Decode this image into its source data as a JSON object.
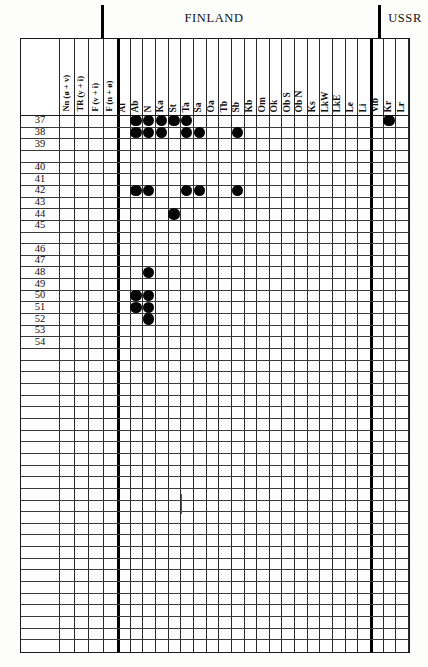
{
  "document": {
    "type": "distribution-grid-table",
    "caption_top": [
      "FINLAND",
      "USSR"
    ]
  },
  "header": {
    "finland_label": "FINLAND",
    "ussr_label": "USSR"
  },
  "grid": {
    "row_label_header": "",
    "columns": [
      {
        "key": "Nn",
        "label": "Nn (ø + v)",
        "group": "left",
        "wide": true
      },
      {
        "key": "TR",
        "label": "TR (y + i)",
        "group": "left",
        "wide": true
      },
      {
        "key": "Fvi",
        "label": "F (v + i)",
        "group": "left",
        "wide": true
      },
      {
        "key": "Fno",
        "label": "F (n + ø)",
        "group": "left",
        "wide": true
      },
      {
        "key": "Al",
        "label": "Al",
        "group": "finland",
        "wide": false
      },
      {
        "key": "Ab",
        "label": "Ab",
        "group": "finland",
        "wide": false
      },
      {
        "key": "N",
        "label": "N",
        "group": "finland",
        "wide": false
      },
      {
        "key": "Ka",
        "label": "Ka",
        "group": "finland",
        "wide": false
      },
      {
        "key": "St",
        "label": "St",
        "group": "finland",
        "wide": false
      },
      {
        "key": "Ta",
        "label": "Ta",
        "group": "finland",
        "wide": false
      },
      {
        "key": "Sa",
        "label": "Sa",
        "group": "finland",
        "wide": false
      },
      {
        "key": "Oa",
        "label": "Oa",
        "group": "finland",
        "wide": false
      },
      {
        "key": "Tb",
        "label": "Tb",
        "group": "finland",
        "wide": false
      },
      {
        "key": "Sb",
        "label": "Sb",
        "group": "finland",
        "wide": false
      },
      {
        "key": "Kb",
        "label": "Kb",
        "group": "finland",
        "wide": false
      },
      {
        "key": "Om",
        "label": "Om",
        "group": "finland",
        "wide": false
      },
      {
        "key": "Ok",
        "label": "Ok",
        "group": "finland",
        "wide": false
      },
      {
        "key": "ObS",
        "label": "Ob S",
        "group": "finland",
        "wide": false
      },
      {
        "key": "ObN",
        "label": "Ob N",
        "group": "finland",
        "wide": false
      },
      {
        "key": "Ks",
        "label": "Ks",
        "group": "finland",
        "wide": false
      },
      {
        "key": "LkW",
        "label": "LkW",
        "group": "finland",
        "wide": false
      },
      {
        "key": "LkE",
        "label": "LkE",
        "group": "finland",
        "wide": false
      },
      {
        "key": "Le",
        "label": "Le",
        "group": "finland",
        "wide": false
      },
      {
        "key": "Li",
        "label": "Li",
        "group": "finland",
        "wide": false
      },
      {
        "key": "Vib",
        "label": "Vib",
        "group": "ussr",
        "wide": false
      },
      {
        "key": "Kr",
        "label": "Kr",
        "group": "ussr",
        "wide": false
      },
      {
        "key": "Lr",
        "label": "Lr",
        "group": "ussr",
        "wide": false
      }
    ],
    "rows": [
      {
        "label": "37",
        "dots": [
          "Ab",
          "N",
          "Ka",
          "St",
          "Ta",
          "Kr"
        ]
      },
      {
        "label": "38",
        "dots": [
          "Ab",
          "N",
          "Ka",
          "Ta",
          "Sa",
          "Sb"
        ]
      },
      {
        "label": "39",
        "dots": []
      },
      {
        "label": "",
        "dots": []
      },
      {
        "label": "40",
        "dots": []
      },
      {
        "label": "41",
        "dots": []
      },
      {
        "label": "42",
        "dots": [
          "Ab",
          "N",
          "Ta",
          "Sa",
          "Sb"
        ]
      },
      {
        "label": "43",
        "dots": []
      },
      {
        "label": "44",
        "dots": [
          "St"
        ]
      },
      {
        "label": "45",
        "dots": []
      },
      {
        "label": "",
        "dots": []
      },
      {
        "label": "46",
        "dots": []
      },
      {
        "label": "47",
        "dots": []
      },
      {
        "label": "48",
        "dots": [
          "N"
        ]
      },
      {
        "label": "49",
        "dots": []
      },
      {
        "label": "50",
        "dots": [
          "Ab",
          "N"
        ]
      },
      {
        "label": "51",
        "dots": [
          "Ab",
          "N"
        ]
      },
      {
        "label": "52",
        "dots": [
          "N"
        ]
      },
      {
        "label": "53",
        "dots": []
      },
      {
        "label": "54",
        "dots": []
      },
      {
        "label": "",
        "dots": []
      },
      {
        "label": "",
        "dots": []
      },
      {
        "label": "",
        "dots": []
      },
      {
        "label": "",
        "dots": []
      },
      {
        "label": "",
        "dots": []
      },
      {
        "label": "",
        "dots": []
      },
      {
        "label": "",
        "dots": []
      },
      {
        "label": "",
        "dots": []
      },
      {
        "label": "",
        "dots": []
      },
      {
        "label": "",
        "dots": []
      },
      {
        "label": "",
        "dots": []
      },
      {
        "label": "",
        "dots": []
      },
      {
        "label": "",
        "dots": []
      },
      {
        "label": "",
        "dots": []
      },
      {
        "label": "",
        "dots": []
      },
      {
        "label": "",
        "dots": []
      },
      {
        "label": "",
        "dots": []
      },
      {
        "label": "",
        "dots": []
      },
      {
        "label": "",
        "dots": []
      },
      {
        "label": "",
        "dots": []
      },
      {
        "label": "",
        "dots": []
      },
      {
        "label": "",
        "dots": []
      },
      {
        "label": "",
        "dots": []
      },
      {
        "label": "",
        "dots": []
      },
      {
        "label": "",
        "dots": []
      },
      {
        "label": "",
        "dots": []
      }
    ]
  },
  "chart_data": {
    "type": "table",
    "categories": [
      "Nn (ø + v)",
      "TR (y + i)",
      "F (v + i)",
      "F (n + ø)",
      "Al",
      "Ab",
      "N",
      "Ka",
      "St",
      "Ta",
      "Sa",
      "Oa",
      "Tb",
      "Sb",
      "Kb",
      "Om",
      "Ok",
      "Ob S",
      "Ob N",
      "Ks",
      "LkW",
      "LkE",
      "Le",
      "Li",
      "Vib",
      "Kr",
      "Lr"
    ],
    "row_labels": [
      "37",
      "38",
      "39",
      "40",
      "41",
      "42",
      "43",
      "44",
      "45",
      "46",
      "47",
      "48",
      "49",
      "50",
      "51",
      "52",
      "53",
      "54"
    ],
    "marks": [
      {
        "row": "37",
        "columns": [
          "Ab",
          "N",
          "Ka",
          "St",
          "Ta",
          "Kr"
        ]
      },
      {
        "row": "38",
        "columns": [
          "Ab",
          "N",
          "Ka",
          "Ta",
          "Sa",
          "Sb"
        ]
      },
      {
        "row": "42",
        "columns": [
          "Ab",
          "N",
          "Ta",
          "Sa",
          "Sb"
        ]
      },
      {
        "row": "44",
        "columns": [
          "St"
        ]
      },
      {
        "row": "48",
        "columns": [
          "N"
        ]
      },
      {
        "row": "50",
        "columns": [
          "Ab",
          "N"
        ]
      },
      {
        "row": "51",
        "columns": [
          "Ab",
          "N"
        ]
      },
      {
        "row": "52",
        "columns": [
          "N"
        ]
      }
    ],
    "grid": true,
    "legend": "filled circle = presence"
  },
  "colors": {
    "ink": "#050505",
    "rule": "#2a2a2a",
    "paper": "#fdfdfb"
  }
}
